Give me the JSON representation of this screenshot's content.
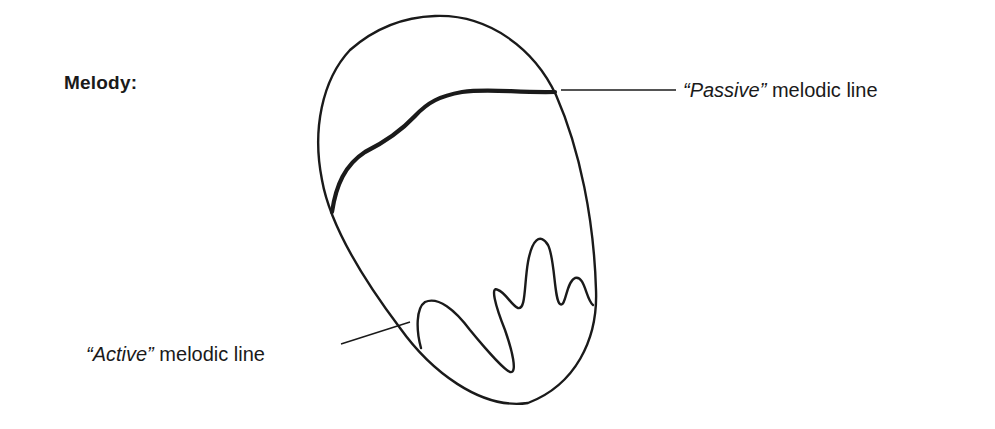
{
  "heading": "Melody:",
  "labels": {
    "passive": {
      "quoted": "“Passive”",
      "rest": " melodic line"
    },
    "active": {
      "quoted": "“Active”",
      "rest": " melodic line"
    }
  },
  "colors": {
    "ink": "#1a1a1a",
    "background": "#ffffff"
  }
}
